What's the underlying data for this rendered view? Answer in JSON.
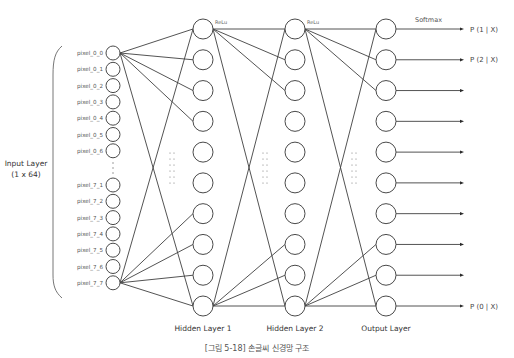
{
  "diagram": {
    "title": "[그림 5-18] 손글씨 신경망 구조",
    "input_layer": {
      "label_line1": "Input Layer",
      "label_line2": "(1 x 64)",
      "top_nodes": [
        "pixel_0_0",
        "pixel_0_1",
        "pixel_0_2",
        "pixel_0_3",
        "pixel_0_4",
        "pixel_0_5",
        "pixel_0_6"
      ],
      "bottom_nodes": [
        "pixel_7_1",
        "pixel_7_2",
        "pixel_7_3",
        "pixel_7_4",
        "pixel_7_5",
        "pixel_7_6",
        "pixel_7_7"
      ],
      "ellipsis": "⋮"
    },
    "hidden_layer_1": {
      "label": "Hidden Layer 1",
      "node_count": 10,
      "activation": "ReLu"
    },
    "hidden_layer_2": {
      "label": "Hidden Layer 2",
      "node_count": 10,
      "activation": "ReLu"
    },
    "output_layer": {
      "label": "Output Layer",
      "node_count": 10,
      "activation": "Softmax",
      "outputs": [
        "P (1 | X)",
        "P (2 | X)",
        "",
        "",
        "",
        "",
        "",
        "",
        "",
        "P (0 | X)"
      ]
    },
    "colors": {
      "stroke": "#3f3f3f",
      "text": "#444444",
      "background": "#ffffff"
    }
  }
}
